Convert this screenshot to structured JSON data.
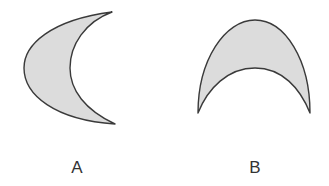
{
  "figures": [
    {
      "id": "A",
      "label": "A",
      "description": "crescent shape opening to the right"
    },
    {
      "id": "B",
      "label": "B",
      "description": "crescent shape opening downward"
    }
  ],
  "colors": {
    "fill": "#dcdcdc",
    "stroke": "#3a3a3a",
    "label": "#333333"
  }
}
